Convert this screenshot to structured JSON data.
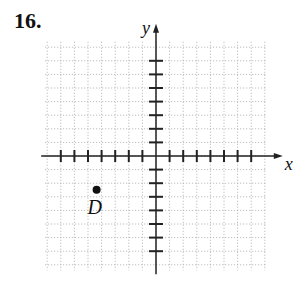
{
  "problem_number": "16.",
  "axes": {
    "x_label": "x",
    "y_label": "y"
  },
  "grid": {
    "x_min": -8,
    "x_max": 8,
    "y_min": -8,
    "y_max": 8
  },
  "points": [
    {
      "label": "D",
      "x": -4,
      "y": -3
    }
  ],
  "colors": {
    "axis": "#222222",
    "grid": "#b0b0b0",
    "point": "#111111"
  }
}
